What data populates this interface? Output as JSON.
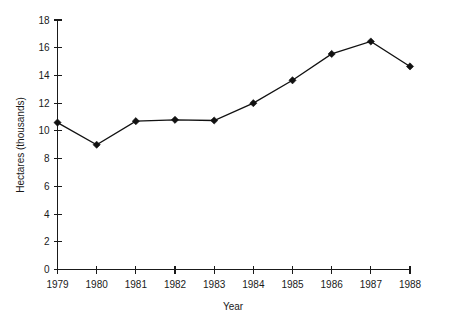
{
  "chart_data": {
    "type": "line",
    "title": "",
    "xlabel": "Year",
    "ylabel": "Hectares (thousands)",
    "categories": [
      "1979",
      "1980",
      "1981",
      "1982",
      "1983",
      "1984",
      "1985",
      "1986",
      "1987",
      "1988"
    ],
    "x": [
      1979,
      1980,
      1981,
      1982,
      1983,
      1984,
      1985,
      1986,
      1987,
      1988
    ],
    "values": [
      10.6,
      9.0,
      10.7,
      10.8,
      10.75,
      12.0,
      13.65,
      15.55,
      16.45,
      14.65
    ],
    "series": [
      {
        "name": "Hectares",
        "values": [
          10.6,
          9.0,
          10.7,
          10.8,
          10.75,
          12.0,
          13.65,
          15.55,
          16.45,
          14.65
        ],
        "color": "#111111",
        "marker": "diamond"
      }
    ],
    "ylim": [
      0,
      18
    ],
    "yticks": [
      0,
      2,
      4,
      6,
      8,
      10,
      12,
      14,
      16,
      18
    ],
    "ytick_labels": [
      "0",
      "2",
      "4",
      "6",
      "8",
      "10",
      "12",
      "14",
      "16",
      "18"
    ],
    "xtick_labels": [
      "1979",
      "1980",
      "1981",
      "1982",
      "1983",
      "1984",
      "1985",
      "1986",
      "1987",
      "1988"
    ],
    "grid": false,
    "legend": "none",
    "background": "#ffffff",
    "axis_color": "#1a1a1a"
  }
}
